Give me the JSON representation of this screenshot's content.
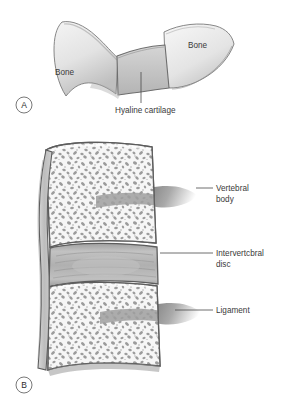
{
  "figure": {
    "background_color": "#ffffff",
    "label_color": "#3a3a3a"
  },
  "panel_a": {
    "letter": "A",
    "description": "Symphysis / synchondrosis: two bone ends joined by hyaline cartilage",
    "labels": [
      {
        "id": "bone-left",
        "text": "Bone",
        "x": 55,
        "y": 75
      },
      {
        "id": "bone-right",
        "text": "Bone",
        "x": 188,
        "y": 48
      },
      {
        "id": "hyaline-cartilage",
        "text": "Hyaline cartilage",
        "x": 115,
        "y": 113
      }
    ],
    "colors": {
      "bone_fill": "#e8e8e8",
      "bone_shadow": "#b9b9b9",
      "cartilage_fill": "#c9c9c9",
      "outline": "#6e6e6e"
    }
  },
  "panel_b": {
    "letter": "B",
    "description": "Intervertebral joint: two vertebral bodies with spongy bone, separated by an intervertebral disc, bound by ligament",
    "labels": [
      {
        "id": "vertebral-body",
        "line1": "Vertebral",
        "line2": "body",
        "x": 216,
        "y": 191
      },
      {
        "id": "intervertebral-disc",
        "line1": "Intervertcbral",
        "line2": "disc",
        "x": 216,
        "y": 256
      },
      {
        "id": "ligament",
        "line1": "Ligament",
        "line2": "",
        "x": 216,
        "y": 313
      }
    ],
    "colors": {
      "cortical_fill": "#f1f1f1",
      "spongy_fill": "#f4f4f4",
      "trabecula": "#8d8d8d",
      "disc_fill": "#b5b5b5",
      "disc_band": "#9d9d9d",
      "ligament_fill": "#bdbdbd",
      "process_shadow": "#8a8a8a",
      "outline": "#5d5d5d"
    }
  }
}
